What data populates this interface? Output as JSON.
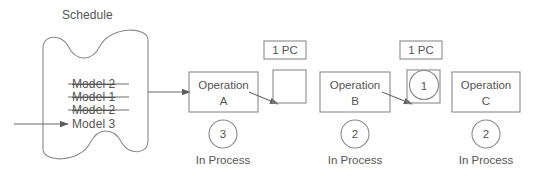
{
  "diagram": {
    "title": "Schedule",
    "schedule": {
      "label": "Schedule",
      "entries": [
        {
          "text": "Model 2",
          "struck": true
        },
        {
          "text": "Model 1",
          "struck": true
        },
        {
          "text": "Model 2",
          "struck": true
        },
        {
          "text": "Model 3",
          "struck": false
        }
      ]
    },
    "operations": [
      {
        "name_line1": "Operation",
        "name_line2": "A",
        "count": "3",
        "status": "In Process"
      },
      {
        "name_line1": "Operation",
        "name_line2": "B",
        "count": "2",
        "status": "In Process"
      },
      {
        "name_line1": "Operation",
        "name_line2": "C",
        "count": "2",
        "status": "In Process"
      }
    ],
    "buffers": [
      {
        "capacity_label": "1 PC",
        "contents": ""
      },
      {
        "capacity_label": "1 PC",
        "contents": "1"
      }
    ],
    "colors": {
      "line": "#7a7a7a",
      "text": "#555555",
      "background": "#ffffff"
    }
  }
}
